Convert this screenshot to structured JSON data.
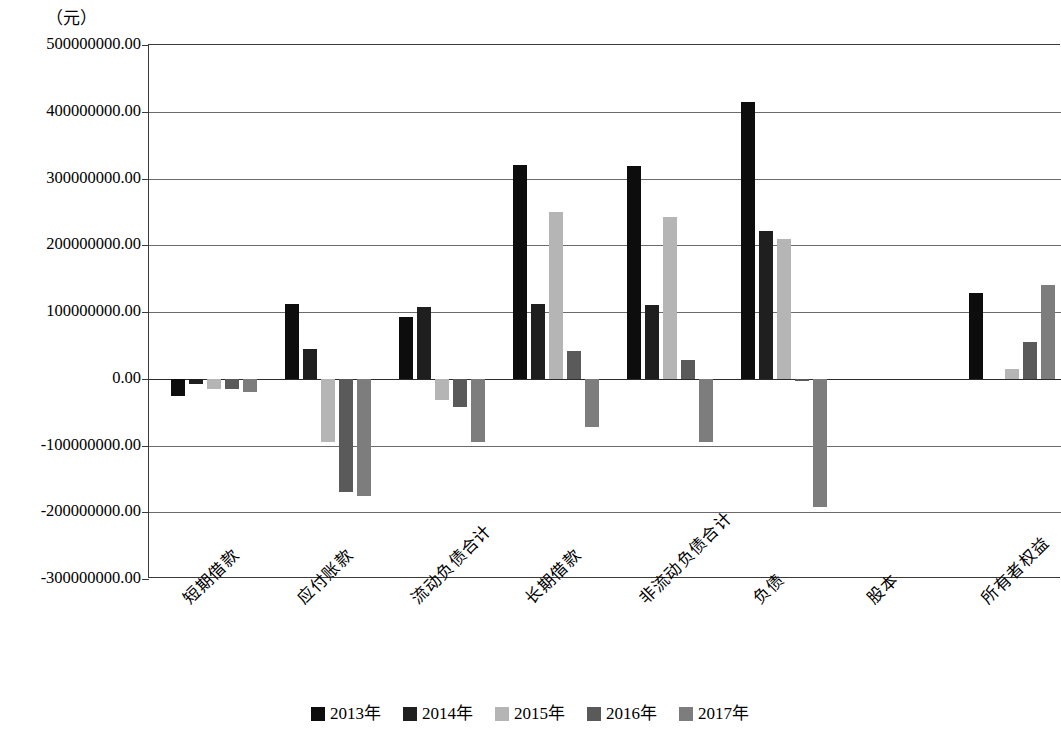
{
  "chart_data": {
    "type": "bar",
    "title": "",
    "subtitle": "",
    "unit_label": "（元）",
    "xlabel": "",
    "ylabel": "",
    "ylim": [
      -300000000,
      500000000
    ],
    "ytick_step": 100000000,
    "grid": true,
    "legend_position": "bottom",
    "orientation": "vertical",
    "ytick_labels": [
      "500000000.00",
      "400000000.00",
      "300000000.00",
      "200000000.00",
      "100000000.00",
      "0.00",
      "-100000000.00",
      "-200000000.00",
      "-300000000.00"
    ],
    "ytick_values": [
      500000000,
      400000000,
      300000000,
      200000000,
      100000000,
      0,
      -100000000,
      -200000000,
      -300000000
    ],
    "categories": [
      "短期借款",
      "应付账款",
      "流动负债合计",
      "长期借款",
      "非流动负债合计",
      "负债",
      "股本",
      "所有者权益"
    ],
    "series": [
      {
        "name": "2013年",
        "color": "#0d0d0d",
        "values": [
          -26000000,
          112000000,
          92000000,
          320000000,
          318000000,
          415000000,
          0,
          128000000
        ]
      },
      {
        "name": "2014年",
        "color": "#1f1f1f",
        "values": [
          -8000000,
          45000000,
          107000000,
          112000000,
          110000000,
          222000000,
          0,
          0
        ]
      },
      {
        "name": "2015年",
        "color": "#b5b5b5",
        "values": [
          -15000000,
          -95000000,
          -32000000,
          250000000,
          242000000,
          210000000,
          0,
          15000000
        ]
      },
      {
        "name": "2016年",
        "color": "#5a5a5a",
        "values": [
          -16000000,
          -170000000,
          -42000000,
          42000000,
          28000000,
          -3000000,
          0,
          55000000
        ]
      },
      {
        "name": "2017年",
        "color": "#7d7d7d",
        "values": [
          -20000000,
          -175000000,
          -95000000,
          -73000000,
          -95000000,
          -192000000,
          0,
          140000000
        ]
      }
    ]
  },
  "legend": {
    "items": [
      {
        "label": "2013年",
        "color": "#0d0d0d"
      },
      {
        "label": "2014年",
        "color": "#1f1f1f"
      },
      {
        "label": "2015年",
        "color": "#b5b5b5"
      },
      {
        "label": "2016年",
        "color": "#5a5a5a"
      },
      {
        "label": "2017年",
        "color": "#7d7d7d"
      }
    ]
  }
}
